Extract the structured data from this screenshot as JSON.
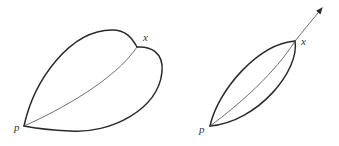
{
  "figures": [
    {
      "id": "left",
      "description": "Two lobes bounded by curves from p to x, joined by a thin interior curve",
      "labels": {
        "p": "p",
        "x": "x"
      },
      "points": {
        "p": [
          24,
          126
        ],
        "x": [
          137,
          47
        ]
      }
    },
    {
      "id": "right",
      "description": "Narrow lens between p and x with thin interior curve; arrow continues past x",
      "labels": {
        "p": "p",
        "x": "x"
      },
      "points": {
        "p": [
          210,
          126
        ],
        "x": [
          295,
          41
        ],
        "arrow_tip": [
          322,
          8
        ]
      }
    }
  ],
  "colors": {
    "stroke": "#2a2a2a",
    "thin_stroke": "#4a4a4a",
    "label": "#333333",
    "background": "#ffffff"
  }
}
